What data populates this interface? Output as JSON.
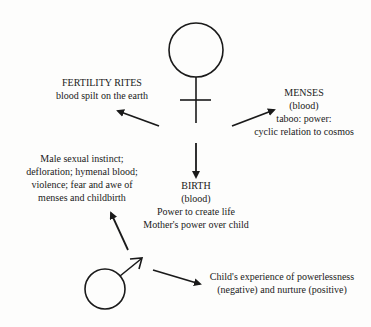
{
  "symbols": {
    "female": "female-symbol",
    "male": "male-symbol"
  },
  "nodes": {
    "fertility": {
      "title": "FERTILITY RITES",
      "lines": [
        "blood spilt on the earth"
      ]
    },
    "menses": {
      "title": "MENSES",
      "lines": [
        "(blood)",
        "taboo: power:",
        "cyclic relation to cosmos"
      ]
    },
    "birth": {
      "title": "BIRTH",
      "lines": [
        "(blood)",
        "Power to create life",
        "Mother's power over child"
      ]
    },
    "male_instinct": {
      "lines": [
        "Male sexual instinct;",
        "defloration; hymenal blood;",
        "violence; fear and awe of",
        "menses and childbirth"
      ]
    },
    "child": {
      "lines": [
        "Child's experience of powerlessness",
        "(negative) and nurture (positive)"
      ]
    }
  },
  "colors": {
    "ink": "#1a1a1a",
    "background": "#fdfdfc"
  }
}
